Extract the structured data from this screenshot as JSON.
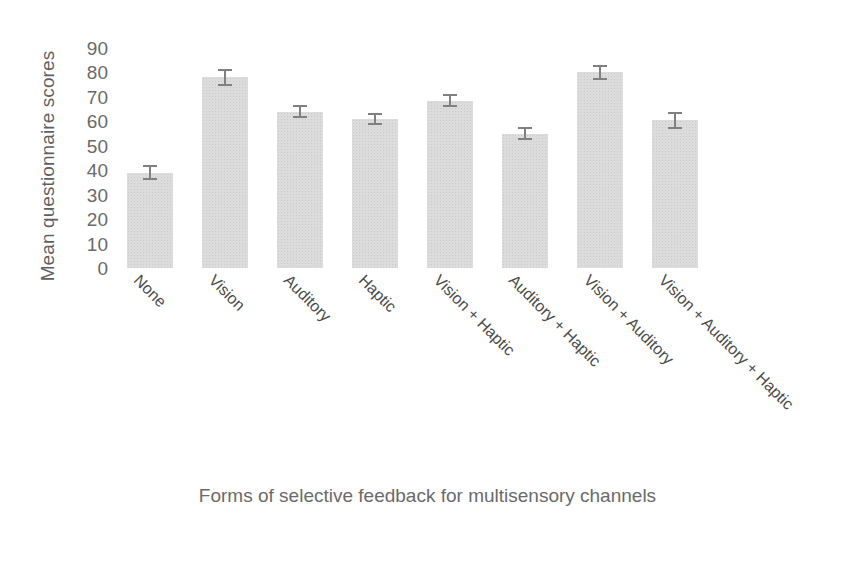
{
  "chart_data": {
    "type": "bar",
    "title": "",
    "xlabel": "Forms of selective feedback for multisensory channels",
    "ylabel": "Mean questionnaire scores",
    "categories": [
      "None",
      "Vision",
      "Auditory",
      "Haptic",
      "Vision + Haptic",
      "Auditory + Haptic",
      "Vision + Auditory",
      "Vision + Auditory + Haptic"
    ],
    "values": [
      39,
      78,
      64,
      61,
      68.5,
      55,
      80,
      60.5
    ],
    "errors": [
      3,
      3.5,
      2.5,
      2.5,
      2.5,
      2.5,
      3,
      3.5
    ],
    "ylim": [
      0,
      90
    ],
    "ytick_labels": [
      "90",
      "80",
      "70",
      "60",
      "50",
      "40",
      "30",
      "20",
      "10",
      "0"
    ],
    "ytick_values": [
      90,
      80,
      70,
      60,
      50,
      40,
      30,
      20,
      10,
      0
    ],
    "grid": false,
    "legend": "none",
    "bar_color": "#dcdcdc",
    "error_color": "#808080",
    "text_color": "#5f5f5f"
  }
}
